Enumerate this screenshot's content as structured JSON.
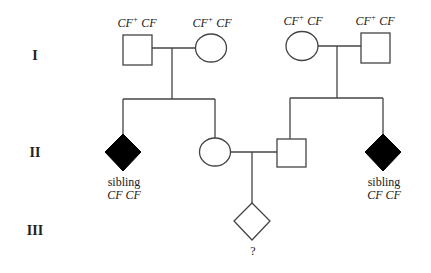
{
  "generations": [
    {
      "label": "I",
      "y": 48
    },
    {
      "label": "II",
      "y": 153
    },
    {
      "label": "III",
      "y": 231
    }
  ],
  "individuals": {
    "gen1_left_father": {
      "sex": "male",
      "shape": "square",
      "affected": false,
      "genotype_a": "CF",
      "genotype_a_sup": "+",
      "genotype_b": "CF"
    },
    "gen1_left_mother": {
      "sex": "female",
      "shape": "circle",
      "affected": false,
      "genotype_a": "CF",
      "genotype_a_sup": "+",
      "genotype_b": "CF"
    },
    "gen1_right_mother": {
      "sex": "female",
      "shape": "circle",
      "affected": false,
      "genotype_a": "CF",
      "genotype_a_sup": "+",
      "genotype_b": "CF"
    },
    "gen1_right_father": {
      "sex": "male",
      "shape": "square",
      "affected": false,
      "genotype_a": "CF",
      "genotype_a_sup": "+",
      "genotype_b": "CF"
    },
    "gen2_left_sibling": {
      "sex": "unknown",
      "shape": "diamond",
      "affected": true,
      "label": "sibling",
      "genotype": "CF CF"
    },
    "gen2_mother": {
      "sex": "female",
      "shape": "circle",
      "affected": false
    },
    "gen2_father": {
      "sex": "male",
      "shape": "square",
      "affected": false
    },
    "gen2_right_sibling": {
      "sex": "unknown",
      "shape": "diamond",
      "affected": true,
      "label": "sibling",
      "genotype": "CF CF"
    },
    "gen3_child": {
      "sex": "unknown",
      "shape": "diamond",
      "affected": false,
      "label": "?"
    }
  },
  "colors": {
    "line": "#444444",
    "affected_fill": "#000000",
    "unaffected_fill": "#ffffff"
  }
}
